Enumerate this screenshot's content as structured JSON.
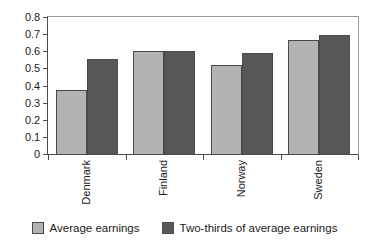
{
  "chart_data": {
    "type": "bar",
    "title": "",
    "subtitle": "",
    "xlabel": "",
    "ylabel": "",
    "categories": [
      "Denmark",
      "Finland",
      "Norway",
      "Sweden"
    ],
    "series": [
      {
        "name": "Average earnings",
        "color": "#b3b3b3",
        "values": [
          0.375,
          0.6,
          0.52,
          0.665
        ]
      },
      {
        "name": "Two-thirds of average earnings",
        "color": "#575757",
        "values": [
          0.555,
          0.6,
          0.59,
          0.695
        ]
      }
    ],
    "ylim": [
      0,
      0.8
    ],
    "ytick_values": [
      0,
      0.1,
      0.2,
      0.3,
      0.4,
      0.5,
      0.6,
      0.7,
      0.8
    ],
    "ytick_labels": [
      "0",
      "0.1",
      "0.2",
      "0.3",
      "0.4",
      "0.5",
      "0.6",
      "0.7",
      "0.8"
    ],
    "grid": false,
    "legend_position": "bottom",
    "x_tick_labels_rotation": -90
  },
  "legend": {
    "items": [
      {
        "label": "Average earnings",
        "swatch": "light"
      },
      {
        "label": "Two-thirds of average earnings",
        "swatch": "dark"
      }
    ]
  }
}
